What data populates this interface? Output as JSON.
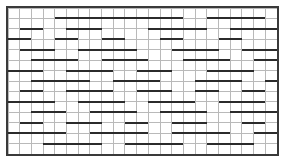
{
  "figure": {
    "type": "grid-pattern",
    "width": 285,
    "height": 162
  },
  "chart_data": {
    "type": "heatmap",
    "title": "",
    "xlabel": "",
    "ylabel": "",
    "grid": true,
    "legend": null,
    "axis": {
      "x_range": [
        0,
        23
      ],
      "y_range": [
        0,
        14
      ],
      "x_tick_labels": [],
      "y_tick_labels": []
    },
    "geometry": {
      "plot_left": 8,
      "plot_top": 8,
      "plot_right": 277,
      "plot_bottom": 154,
      "columns": 23,
      "rows": 14,
      "cell_width": 11.7,
      "cell_height": 10.43
    },
    "style": {
      "background_color": "#ffffff",
      "grid_line_color": "#b9b9b9",
      "grid_line_width": 1,
      "border_color": "#3a3a3a",
      "border_width": 2,
      "bar_color": "#2b2b2b",
      "bar_thickness": 2
    },
    "bars": [
      {
        "row": 1,
        "col_start": 4,
        "col_end": 15
      },
      {
        "row": 1,
        "col_start": 17,
        "col_end": 22
      },
      {
        "row": 2,
        "col_start": 1,
        "col_end": 3
      },
      {
        "row": 2,
        "col_start": 5,
        "col_end": 8
      },
      {
        "row": 2,
        "col_start": 12,
        "col_end": 17
      },
      {
        "row": 2,
        "col_start": 19,
        "col_end": 23
      },
      {
        "row": 3,
        "col_start": 0,
        "col_end": 2
      },
      {
        "row": 3,
        "col_start": 4,
        "col_end": 6
      },
      {
        "row": 3,
        "col_start": 8,
        "col_end": 10
      },
      {
        "row": 3,
        "col_start": 13,
        "col_end": 15
      },
      {
        "row": 3,
        "col_start": 18,
        "col_end": 20
      },
      {
        "row": 4,
        "col_start": 1,
        "col_end": 4
      },
      {
        "row": 4,
        "col_start": 6,
        "col_end": 11
      },
      {
        "row": 4,
        "col_start": 14,
        "col_end": 18
      },
      {
        "row": 4,
        "col_start": 20,
        "col_end": 23
      },
      {
        "row": 5,
        "col_start": 2,
        "col_end": 6
      },
      {
        "row": 5,
        "col_start": 8,
        "col_end": 12
      },
      {
        "row": 5,
        "col_start": 15,
        "col_end": 19
      },
      {
        "row": 5,
        "col_start": 21,
        "col_end": 23
      },
      {
        "row": 6,
        "col_start": 0,
        "col_end": 3
      },
      {
        "row": 6,
        "col_start": 5,
        "col_end": 9
      },
      {
        "row": 6,
        "col_start": 11,
        "col_end": 14
      },
      {
        "row": 6,
        "col_start": 17,
        "col_end": 21
      },
      {
        "row": 7,
        "col_start": 2,
        "col_end": 7
      },
      {
        "row": 7,
        "col_start": 9,
        "col_end": 13
      },
      {
        "row": 7,
        "col_start": 16,
        "col_end": 20
      },
      {
        "row": 7,
        "col_start": 22,
        "col_end": 23
      },
      {
        "row": 8,
        "col_start": 1,
        "col_end": 3
      },
      {
        "row": 8,
        "col_start": 5,
        "col_end": 9
      },
      {
        "row": 8,
        "col_start": 11,
        "col_end": 14
      },
      {
        "row": 8,
        "col_start": 16,
        "col_end": 18
      },
      {
        "row": 8,
        "col_start": 20,
        "col_end": 22
      },
      {
        "row": 9,
        "col_start": 0,
        "col_end": 4
      },
      {
        "row": 9,
        "col_start": 6,
        "col_end": 10
      },
      {
        "row": 9,
        "col_start": 12,
        "col_end": 16
      },
      {
        "row": 9,
        "col_start": 18,
        "col_end": 22
      },
      {
        "row": 10,
        "col_start": 2,
        "col_end": 5
      },
      {
        "row": 10,
        "col_start": 7,
        "col_end": 11
      },
      {
        "row": 10,
        "col_start": 13,
        "col_end": 17
      },
      {
        "row": 10,
        "col_start": 19,
        "col_end": 23
      },
      {
        "row": 11,
        "col_start": 1,
        "col_end": 3
      },
      {
        "row": 11,
        "col_start": 5,
        "col_end": 8
      },
      {
        "row": 11,
        "col_start": 10,
        "col_end": 12
      },
      {
        "row": 11,
        "col_start": 14,
        "col_end": 17
      },
      {
        "row": 11,
        "col_start": 20,
        "col_end": 22
      },
      {
        "row": 12,
        "col_start": 0,
        "col_end": 5
      },
      {
        "row": 12,
        "col_start": 7,
        "col_end": 12
      },
      {
        "row": 12,
        "col_start": 14,
        "col_end": 19
      },
      {
        "row": 12,
        "col_start": 21,
        "col_end": 23
      },
      {
        "row": 13,
        "col_start": 3,
        "col_end": 8
      },
      {
        "row": 13,
        "col_start": 10,
        "col_end": 15
      },
      {
        "row": 13,
        "col_start": 17,
        "col_end": 21
      }
    ]
  }
}
